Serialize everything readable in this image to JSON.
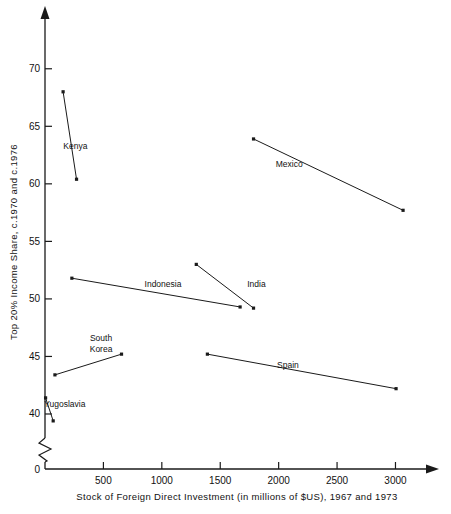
{
  "chart_data": {
    "type": "line",
    "title": "",
    "xlabel": "Stock of Foreign Direct Investment (in millions of $US), 1967 and 1973",
    "ylabel": "Top 20% Income Share, c.1970 and c.1976",
    "xlim": [
      0,
      3150
    ],
    "ylim": [
      38,
      72.5
    ],
    "y_axis_break": true,
    "y_break_label": "0",
    "grid": false,
    "legend": "inline-labels",
    "xticks": [
      0,
      500,
      1000,
      1500,
      2000,
      2500,
      3000
    ],
    "xtick_labels": [
      "0",
      "500",
      "1000",
      "1500",
      "2000",
      "2500",
      "3000"
    ],
    "yticks": [
      40,
      45,
      50,
      55,
      60,
      65,
      70
    ],
    "ytick_labels": [
      "40",
      "45",
      "50",
      "55",
      "60",
      "65",
      "70"
    ],
    "series": [
      {
        "name": "Kenya",
        "label": "Kenya",
        "label_x": 260,
        "label_y": 63.0,
        "x": [
          155,
          270
        ],
        "y": [
          68.0,
          60.4
        ]
      },
      {
        "name": "Mexico",
        "label": "Mexico",
        "label_x": 2090,
        "label_y": 61.5,
        "x": [
          1785,
          3065
        ],
        "y": [
          63.9,
          57.7
        ]
      },
      {
        "name": "Indonesia",
        "label": "Indonesia",
        "label_x": 1010,
        "label_y": 51.0,
        "x": [
          230,
          1670
        ],
        "y": [
          51.8,
          49.3
        ]
      },
      {
        "name": "India",
        "label": "India",
        "label_x": 1810,
        "label_y": 51.0,
        "x": [
          1295,
          1785
        ],
        "y": [
          53.0,
          49.2
        ]
      },
      {
        "name": "South Korea",
        "label": "South\nKorea",
        "label_x": 480,
        "label_y": 46.3,
        "x": [
          85,
          655
        ],
        "y": [
          43.4,
          45.2
        ]
      },
      {
        "name": "Spain",
        "label": "Spain",
        "label_x": 2080,
        "label_y": 44.0,
        "x": [
          1390,
          3005
        ],
        "y": [
          45.2,
          42.2
        ]
      },
      {
        "name": "Yugoslavia",
        "label": "Yugoslavia",
        "label_x": 170,
        "label_y": 40.6,
        "x": [
          5,
          70
        ],
        "y": [
          41.4,
          39.4
        ]
      }
    ]
  }
}
